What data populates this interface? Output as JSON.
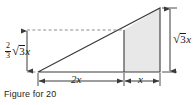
{
  "figure": {
    "caption": "Figure for 20",
    "colors": {
      "stroke": "#3a3a3a",
      "shade_fill": "#e8e8e8",
      "dashed": "#8c8c8c",
      "text": "#1a1a1a",
      "background": "#ffffff"
    },
    "geometry": {
      "base_left_x": 38,
      "base_right_x": 160,
      "baseline_y": 72,
      "apex_x": 160,
      "apex_y": 8,
      "divider_x": 124,
      "divider_top_y": 30,
      "dashed_line_y": 30,
      "dashed_line_from_x": 27,
      "dashed_line_to_x": 124
    },
    "labels": {
      "left_height": {
        "name": "two-thirds-sqrt-3-x",
        "fraction_numerator": "2",
        "fraction_denominator": "3",
        "radical_sign": "√",
        "radicand": "3",
        "variable": "x"
      },
      "right_height": {
        "name": "sqrt-3-x",
        "radical_sign": "√",
        "radicand": "3",
        "variable": "x"
      },
      "base_segment_left": "2x",
      "base_segment_right": "x"
    }
  }
}
